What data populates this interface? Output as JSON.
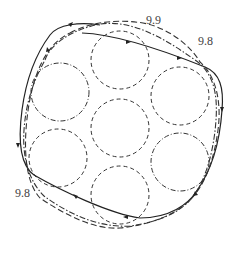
{
  "diagram": {
    "title": "",
    "labels": [
      {
        "id": "top",
        "text": "9.9",
        "x": 146,
        "y": 24
      },
      {
        "id": "right",
        "text": "9.8",
        "x": 198,
        "y": 45
      },
      {
        "id": "left",
        "text": "9.8",
        "x": 15,
        "y": 197
      }
    ],
    "circles": [
      {
        "name": "circle-top",
        "cx": 120,
        "cy": 60,
        "r": 29
      },
      {
        "name": "circle-upper-left",
        "cx": 60,
        "cy": 92,
        "r": 29
      },
      {
        "name": "circle-upper-right",
        "cx": 180,
        "cy": 96,
        "r": 29
      },
      {
        "name": "circle-center",
        "cx": 120,
        "cy": 128,
        "r": 29
      },
      {
        "name": "circle-lower-left",
        "cx": 58,
        "cy": 158,
        "r": 29
      },
      {
        "name": "circle-lower-right",
        "cx": 180,
        "cy": 162,
        "r": 29
      },
      {
        "name": "circle-bottom",
        "cx": 120,
        "cy": 195,
        "r": 29
      }
    ],
    "contours": [
      {
        "name": "solid-contour",
        "style": "solid"
      },
      {
        "name": "dashed-contour",
        "style": "dashed"
      },
      {
        "name": "dashdot-contour",
        "style": "dash-dot"
      }
    ]
  }
}
